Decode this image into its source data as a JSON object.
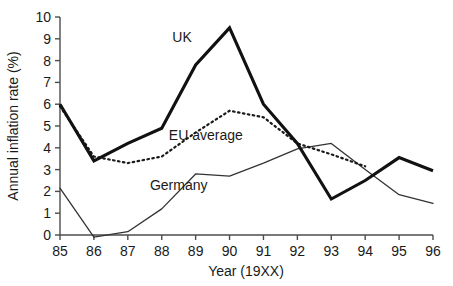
{
  "chart_data": {
    "type": "line",
    "title": "",
    "xlabel": "Year (19XX)",
    "ylabel": "Annual inflation rate (%)",
    "x": [
      85,
      86,
      87,
      88,
      89,
      90,
      91,
      92,
      93,
      94,
      95,
      96
    ],
    "xtick_labels": [
      "85",
      "86",
      "87",
      "88",
      "89",
      "90",
      "91",
      "92",
      "93",
      "94",
      "95",
      "96"
    ],
    "ytick_labels": [
      "0",
      "1",
      "2",
      "3",
      "4",
      "5",
      "6",
      "7",
      "8",
      "9",
      "10"
    ],
    "ylim": [
      0,
      10
    ],
    "xlim": [
      85,
      96
    ],
    "grid": false,
    "legend_position": "inline-annotations",
    "series": [
      {
        "name": "UK",
        "style": "thick-solid",
        "color": "#111111",
        "x": [
          85,
          86,
          87,
          88,
          89,
          90,
          91,
          92,
          93,
          94,
          95,
          96
        ],
        "values": [
          6.0,
          3.4,
          4.2,
          4.9,
          7.8,
          9.5,
          6.0,
          4.2,
          1.65,
          2.5,
          3.55,
          2.95
        ]
      },
      {
        "name": "EU average",
        "style": "dotted",
        "color": "#1a1a1a",
        "x": [
          85,
          86,
          87,
          88,
          89,
          90,
          91,
          92,
          93,
          94
        ],
        "values": [
          5.9,
          3.6,
          3.3,
          3.6,
          4.7,
          5.7,
          5.4,
          4.2,
          3.7,
          3.15
        ]
      },
      {
        "name": "Germany",
        "style": "thin-solid",
        "color": "#333333",
        "x": [
          85,
          86,
          87,
          88,
          89,
          90,
          91,
          92,
          93,
          94,
          95,
          96
        ],
        "values": [
          2.15,
          -0.1,
          0.15,
          1.2,
          2.8,
          2.7,
          3.3,
          3.95,
          4.2,
          3.0,
          1.85,
          1.45
        ]
      }
    ],
    "annotations": [
      {
        "text": "UK",
        "x": 88.6,
        "y": 8.85
      },
      {
        "text": "EU average",
        "x": 89.3,
        "y": 4.35
      },
      {
        "text": "Germany",
        "x": 88.5,
        "y": 2.05
      }
    ]
  }
}
